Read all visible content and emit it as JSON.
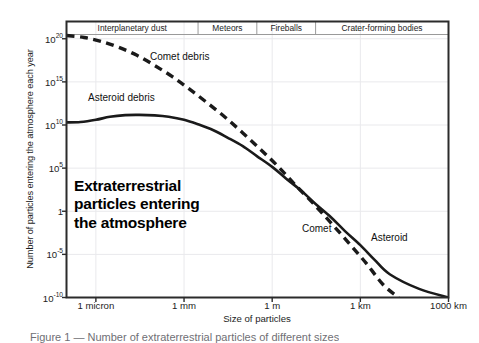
{
  "chart_data": {
    "type": "line",
    "title": "Extraterrestrial\nparticles entering\nthe atmosphere",
    "xlabel": "Size of particles",
    "ylabel": "Number of particles entering the atmosphere each year",
    "grid": true,
    "legend": "inline-annotations",
    "x_scale": "log",
    "y_scale": "log",
    "xlim": [
      1e-07,
      1000000.0
    ],
    "ylim": [
      1e-10,
      1e+22
    ],
    "xticks": [
      {
        "label": "1 micron",
        "value": 1e-06
      },
      {
        "label": "1 mm",
        "value": 0.001
      },
      {
        "label": "1 m",
        "value": 1
      },
      {
        "label": "1 km",
        "value": 1000
      },
      {
        "label": "1000 km",
        "value": 1000000
      }
    ],
    "yticks": [
      {
        "label": "10",
        "exp": "20",
        "value": 1e+20
      },
      {
        "label": "10",
        "exp": "15",
        "value": 1000000000000000.0
      },
      {
        "label": "10",
        "exp": "10",
        "value": 10000000000.0
      },
      {
        "label": "10",
        "exp": "5",
        "value": 100000.0
      },
      {
        "label": "1",
        "exp": "",
        "value": 1
      },
      {
        "label": "10",
        "exp": "-5",
        "value": 1e-05
      },
      {
        "label": "10",
        "exp": "-10",
        "value": 1e-10
      }
    ],
    "categories_band": [
      {
        "label": "Interplanetary dust",
        "start": 1e-07,
        "end": 0.003
      },
      {
        "label": "Meteors",
        "start": 0.003,
        "end": 0.3
      },
      {
        "label": "Fireballs",
        "start": 0.3,
        "end": 30
      },
      {
        "label": "Crater-forming bodies",
        "start": 30,
        "end": 1000000
      }
    ],
    "series": [
      {
        "name": "Comet debris",
        "style": "dashed",
        "color": "#1a1a1a",
        "label_right": "Comet",
        "points": [
          {
            "x": 1e-07,
            "y": 2.4e+20
          },
          {
            "x": 4e-07,
            "y": 1.4e+20
          },
          {
            "x": 1.5e-06,
            "y": 5e+19
          },
          {
            "x": 6e-06,
            "y": 1e+19
          },
          {
            "x": 2.5e-05,
            "y": 1.2e+18
          },
          {
            "x": 0.0001,
            "y": 8e+16
          },
          {
            "x": 0.0004,
            "y": 4000000000000000.0
          },
          {
            "x": 0.0015,
            "y": 150000000000000.0
          },
          {
            "x": 0.006,
            "y": 4000000000000.0
          },
          {
            "x": 0.025,
            "y": 80000000000.0
          },
          {
            "x": 0.1,
            "y": 1200000000.0
          },
          {
            "x": 0.4,
            "y": 15000000.0
          },
          {
            "x": 1.6,
            "y": 150000.0
          },
          {
            "x": 6.0,
            "y": 1200.0
          },
          {
            "x": 25,
            "y": 8.0
          },
          {
            "x": 100,
            "y": 0.045
          },
          {
            "x": 400,
            "y": 0.00022
          },
          {
            "x": 1600,
            "y": 9e-07
          },
          {
            "x": 6000,
            "y": 3e-09
          },
          {
            "x": 20000,
            "y": 1e-10
          }
        ]
      },
      {
        "name": "Asteroid debris",
        "style": "solid",
        "color": "#1a1a1a",
        "label_right": "Asteroid",
        "points": [
          {
            "x": 1e-07,
            "y": 20000000000.0
          },
          {
            "x": 3e-07,
            "y": 22000000000.0
          },
          {
            "x": 1e-06,
            "y": 40000000000.0
          },
          {
            "x": 3e-06,
            "y": 90000000000.0
          },
          {
            "x": 1e-05,
            "y": 140000000000.0
          },
          {
            "x": 3e-05,
            "y": 150000000000.0
          },
          {
            "x": 0.0001,
            "y": 130000000000.0
          },
          {
            "x": 0.0003,
            "y": 90000000000.0
          },
          {
            "x": 0.001,
            "y": 40000000000.0
          },
          {
            "x": 0.003,
            "y": 12000000000.0
          },
          {
            "x": 0.01,
            "y": 2500000000.0
          },
          {
            "x": 0.03,
            "y": 350000000.0
          },
          {
            "x": 0.1,
            "y": 35000000.0
          },
          {
            "x": 0.3,
            "y": 2500000.0
          },
          {
            "x": 1,
            "y": 140000.0
          },
          {
            "x": 3,
            "y": 6000.0
          },
          {
            "x": 10,
            "y": 220.0
          },
          {
            "x": 30,
            "y": 7.0
          },
          {
            "x": 100,
            "y": 0.2
          },
          {
            "x": 300,
            "y": 0.005
          },
          {
            "x": 1000,
            "y": 0.00012
          },
          {
            "x": 3000,
            "y": 2.5e-06
          },
          {
            "x": 10000,
            "y": 5e-08
          },
          {
            "x": 100000,
            "y": 1e-09
          },
          {
            "x": 1000000,
            "y": 1e-10
          }
        ]
      }
    ]
  },
  "caption": {
    "text": "Figure 1 — Number of extraterrestrial particles of different sizes"
  },
  "colors": {
    "axis": "#2b2b2b",
    "grid": "#e9e9ec",
    "curve": "#1a1a1a",
    "text": "#1d1d1d"
  }
}
